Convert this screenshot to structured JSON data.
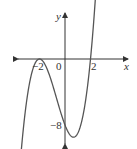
{
  "chart_data": {
    "type": "line",
    "title": "",
    "xlabel": "x",
    "ylabel": "y",
    "function": "f(x) = (x+2)^2 (x-2)",
    "x_ticks": [
      "-2",
      "0",
      "2"
    ],
    "y_ticks": [
      "-8"
    ],
    "key_points": [
      {
        "x": -2,
        "y": 0,
        "note": "touches x-axis"
      },
      {
        "x": 2,
        "y": 0,
        "note": "crosses x-axis"
      },
      {
        "x": 0,
        "y": -8,
        "note": "y-intercept"
      }
    ],
    "xlim": [
      -3,
      3
    ],
    "ylim": [
      -10,
      14
    ],
    "grid": false,
    "legend": "none"
  },
  "labels": {
    "x_axis": "x",
    "y_axis": "y",
    "tick_neg2": "−2",
    "tick_0": "0",
    "tick_2": "2",
    "tick_neg8": "−8"
  },
  "colors": {
    "axis": "#333333",
    "curve": "#555555"
  }
}
